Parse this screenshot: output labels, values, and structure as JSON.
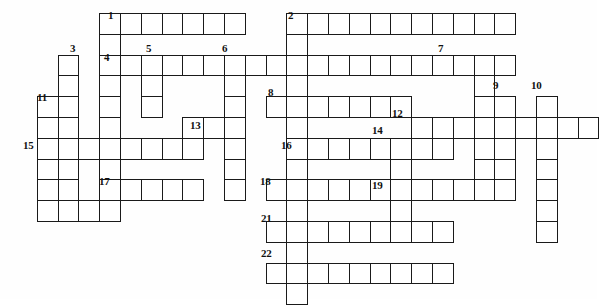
{
  "puzzle": {
    "type": "crossword-grid",
    "title": "Crossword puzzle grid",
    "background_color": "#ffffff",
    "cell_border_color": "#1a1a1a",
    "cell_fill_color": "#ffffff",
    "number_color": "#111111",
    "cell_size": 20.8,
    "origin_x": 16,
    "origin_y": 13,
    "grid_columns": 28,
    "grid_rows": 14,
    "entries": [
      {
        "number": "1",
        "direction": "across",
        "col": 4,
        "row": 0,
        "length": 7
      },
      {
        "number": "2",
        "direction": "across",
        "col": 13,
        "row": 0,
        "length": 11
      },
      {
        "number": "3",
        "direction": "down",
        "col": 2,
        "row": 2,
        "length": 7
      },
      {
        "number": "4",
        "direction": "across",
        "col": 4,
        "row": 2,
        "length": 20
      },
      {
        "number": "5",
        "direction": "down",
        "col": 6,
        "row": 2,
        "length": 4
      },
      {
        "number": "6",
        "direction": "down",
        "col": 10,
        "row": 2,
        "length": 6
      },
      {
        "number": "7",
        "direction": "down",
        "col": 22,
        "row": 2,
        "length": 7
      },
      {
        "number": "8",
        "direction": "across",
        "col": 12,
        "row": 4,
        "length": 7
      },
      {
        "number": "9",
        "direction": "down",
        "col": 23,
        "row": 4,
        "length": 5
      },
      {
        "number": "10",
        "direction": "down",
        "col": 25,
        "row": 4,
        "length": 7
      },
      {
        "number": "11",
        "direction": "down",
        "col": 1,
        "row": 4,
        "length": 6
      },
      {
        "number": "12",
        "direction": "across",
        "col": 19,
        "row": 5,
        "length": 9
      },
      {
        "number": "13",
        "direction": "across",
        "col": 8,
        "row": 5,
        "length": 3
      },
      {
        "number": "14",
        "direction": "down",
        "col": 18,
        "row": 6,
        "length": 5
      },
      {
        "number": "15",
        "direction": "across",
        "col": 1,
        "row": 6,
        "length": 8
      },
      {
        "number": "16",
        "direction": "across",
        "col": 13,
        "row": 6,
        "length": 8
      },
      {
        "number": "17",
        "direction": "across",
        "col": 5,
        "row": 8,
        "length": 4
      },
      {
        "number": "18",
        "direction": "across",
        "col": 12,
        "row": 8,
        "length": 6
      },
      {
        "number": "19",
        "direction": "across",
        "col": 18,
        "row": 8,
        "length": 6
      },
      {
        "number": "21",
        "direction": "across",
        "col": 12,
        "row": 10,
        "length": 9
      },
      {
        "number": "22",
        "direction": "across",
        "col": 12,
        "row": 12,
        "length": 9
      }
    ],
    "cells": [
      [
        4,
        0
      ],
      [
        5,
        0
      ],
      [
        6,
        0
      ],
      [
        7,
        0
      ],
      [
        8,
        0
      ],
      [
        9,
        0
      ],
      [
        10,
        0
      ],
      [
        13,
        0
      ],
      [
        14,
        0
      ],
      [
        15,
        0
      ],
      [
        16,
        0
      ],
      [
        17,
        0
      ],
      [
        18,
        0
      ],
      [
        19,
        0
      ],
      [
        20,
        0
      ],
      [
        21,
        0
      ],
      [
        22,
        0
      ],
      [
        23,
        0
      ],
      [
        4,
        1
      ],
      [
        13,
        1
      ],
      [
        2,
        2
      ],
      [
        4,
        2
      ],
      [
        5,
        2
      ],
      [
        6,
        2
      ],
      [
        7,
        2
      ],
      [
        8,
        2
      ],
      [
        9,
        2
      ],
      [
        10,
        2
      ],
      [
        11,
        2
      ],
      [
        12,
        2
      ],
      [
        13,
        2
      ],
      [
        14,
        2
      ],
      [
        15,
        2
      ],
      [
        16,
        2
      ],
      [
        17,
        2
      ],
      [
        18,
        2
      ],
      [
        19,
        2
      ],
      [
        20,
        2
      ],
      [
        21,
        2
      ],
      [
        22,
        2
      ],
      [
        23,
        2
      ],
      [
        2,
        3
      ],
      [
        4,
        3
      ],
      [
        6,
        3
      ],
      [
        10,
        3
      ],
      [
        13,
        3
      ],
      [
        22,
        3
      ],
      [
        1,
        4
      ],
      [
        2,
        4
      ],
      [
        4,
        4
      ],
      [
        6,
        4
      ],
      [
        10,
        4
      ],
      [
        12,
        4
      ],
      [
        13,
        4
      ],
      [
        14,
        4
      ],
      [
        15,
        4
      ],
      [
        16,
        4
      ],
      [
        17,
        4
      ],
      [
        18,
        4
      ],
      [
        22,
        4
      ],
      [
        23,
        4
      ],
      [
        25,
        4
      ],
      [
        1,
        5
      ],
      [
        2,
        5
      ],
      [
        4,
        5
      ],
      [
        10,
        5
      ],
      [
        13,
        5
      ],
      [
        19,
        5
      ],
      [
        20,
        5
      ],
      [
        21,
        5
      ],
      [
        22,
        5
      ],
      [
        23,
        5
      ],
      [
        24,
        5
      ],
      [
        25,
        5
      ],
      [
        26,
        5
      ],
      [
        27,
        5
      ],
      [
        8,
        5
      ],
      [
        9,
        5
      ],
      [
        10,
        5
      ],
      [
        1,
        6
      ],
      [
        2,
        6
      ],
      [
        3,
        6
      ],
      [
        4,
        6
      ],
      [
        5,
        6
      ],
      [
        6,
        6
      ],
      [
        7,
        6
      ],
      [
        8,
        6
      ],
      [
        10,
        6
      ],
      [
        13,
        6
      ],
      [
        14,
        6
      ],
      [
        15,
        6
      ],
      [
        16,
        6
      ],
      [
        17,
        6
      ],
      [
        18,
        6
      ],
      [
        19,
        6
      ],
      [
        20,
        6
      ],
      [
        22,
        6
      ],
      [
        23,
        6
      ],
      [
        25,
        6
      ],
      [
        1,
        7
      ],
      [
        2,
        7
      ],
      [
        4,
        7
      ],
      [
        10,
        7
      ],
      [
        13,
        7
      ],
      [
        18,
        7
      ],
      [
        22,
        7
      ],
      [
        23,
        7
      ],
      [
        25,
        7
      ],
      [
        1,
        8
      ],
      [
        5,
        8
      ],
      [
        6,
        8
      ],
      [
        7,
        8
      ],
      [
        8,
        8
      ],
      [
        10,
        8
      ],
      [
        12,
        8
      ],
      [
        13,
        8
      ],
      [
        14,
        8
      ],
      [
        15,
        8
      ],
      [
        16,
        8
      ],
      [
        17,
        8
      ],
      [
        18,
        8
      ],
      [
        19,
        8
      ],
      [
        20,
        8
      ],
      [
        21,
        8
      ],
      [
        22,
        8
      ],
      [
        23,
        8
      ],
      [
        25,
        8
      ],
      [
        1,
        9
      ],
      [
        2,
        9
      ],
      [
        3,
        9
      ],
      [
        4,
        9
      ],
      [
        13,
        9
      ],
      [
        18,
        9
      ],
      [
        25,
        9
      ],
      [
        12,
        10
      ],
      [
        13,
        10
      ],
      [
        14,
        10
      ],
      [
        15,
        10
      ],
      [
        16,
        10
      ],
      [
        17,
        10
      ],
      [
        18,
        10
      ],
      [
        19,
        10
      ],
      [
        20,
        10
      ],
      [
        25,
        10
      ],
      [
        13,
        11
      ],
      [
        12,
        12
      ],
      [
        13,
        12
      ],
      [
        14,
        12
      ],
      [
        15,
        12
      ],
      [
        16,
        12
      ],
      [
        17,
        12
      ],
      [
        18,
        12
      ],
      [
        19,
        12
      ],
      [
        20,
        12
      ],
      [
        13,
        13
      ]
    ],
    "cell_runs": [
      {
        "name": "across-1",
        "col": 4,
        "row": 0,
        "len": 7,
        "dir": "h"
      },
      {
        "name": "across-2",
        "col": 13,
        "row": 0,
        "len": 11,
        "dir": "h"
      },
      {
        "name": "down-1",
        "col": 4,
        "row": 0,
        "len": 10,
        "dir": "v"
      },
      {
        "name": "down-2",
        "col": 13,
        "row": 0,
        "len": 14,
        "dir": "v"
      },
      {
        "name": "down-3",
        "col": 2,
        "row": 2,
        "len": 8,
        "dir": "v"
      },
      {
        "name": "across-4",
        "col": 4,
        "row": 2,
        "len": 20,
        "dir": "h"
      },
      {
        "name": "down-5",
        "col": 6,
        "row": 2,
        "len": 3,
        "dir": "v"
      },
      {
        "name": "down-6",
        "col": 10,
        "row": 2,
        "len": 7,
        "dir": "v"
      },
      {
        "name": "down-7",
        "col": 22,
        "row": 2,
        "len": 7,
        "dir": "v"
      },
      {
        "name": "across-8",
        "col": 12,
        "row": 4,
        "len": 7,
        "dir": "h"
      },
      {
        "name": "down-9",
        "col": 23,
        "row": 4,
        "len": 5,
        "dir": "v"
      },
      {
        "name": "down-10",
        "col": 25,
        "row": 4,
        "len": 7,
        "dir": "v"
      },
      {
        "name": "down-11",
        "col": 1,
        "row": 4,
        "len": 6,
        "dir": "v"
      },
      {
        "name": "across-12",
        "col": 19,
        "row": 5,
        "len": 9,
        "dir": "h"
      },
      {
        "name": "across-13",
        "col": 8,
        "row": 5,
        "len": 3,
        "dir": "h"
      },
      {
        "name": "down-14",
        "col": 18,
        "row": 6,
        "len": 4,
        "dir": "v"
      },
      {
        "name": "across-15",
        "col": 1,
        "row": 6,
        "len": 8,
        "dir": "h"
      },
      {
        "name": "across-16",
        "col": 13,
        "row": 6,
        "len": 8,
        "dir": "h"
      },
      {
        "name": "across-17",
        "col": 5,
        "row": 8,
        "len": 4,
        "dir": "h"
      },
      {
        "name": "across-18",
        "col": 12,
        "row": 8,
        "len": 6,
        "dir": "h"
      },
      {
        "name": "across-19",
        "col": 18,
        "row": 8,
        "len": 6,
        "dir": "h"
      },
      {
        "name": "down-15b",
        "col": 1,
        "row": 6,
        "len": 4,
        "dir": "v"
      },
      {
        "name": "across-20",
        "col": 1,
        "row": 9,
        "len": 4,
        "dir": "h"
      },
      {
        "name": "across-21",
        "col": 12,
        "row": 10,
        "len": 9,
        "dir": "h"
      },
      {
        "name": "across-22",
        "col": 12,
        "row": 12,
        "len": 9,
        "dir": "h"
      },
      {
        "name": "down-4b",
        "col": 4,
        "row": 3,
        "len": 7,
        "dir": "v"
      },
      {
        "name": "down-6b",
        "col": 10,
        "row": 3,
        "len": 6,
        "dir": "v"
      },
      {
        "name": "down-13",
        "col": 10,
        "row": 6,
        "len": 3,
        "dir": "v"
      }
    ],
    "numbers": [
      {
        "label": "1",
        "x": 108,
        "y": 10
      },
      {
        "label": "2",
        "x": 288,
        "y": 10
      },
      {
        "label": "3",
        "x": 70,
        "y": 43
      },
      {
        "label": "4",
        "x": 104,
        "y": 52
      },
      {
        "label": "5",
        "x": 146,
        "y": 43
      },
      {
        "label": "6",
        "x": 222,
        "y": 43
      },
      {
        "label": "7",
        "x": 438,
        "y": 43
      },
      {
        "label": "8",
        "x": 268,
        "y": 87
      },
      {
        "label": "9",
        "x": 493,
        "y": 80
      },
      {
        "label": "10",
        "x": 531,
        "y": 80
      },
      {
        "label": "11",
        "x": 37,
        "y": 92
      },
      {
        "label": "12",
        "x": 392,
        "y": 108
      },
      {
        "label": "13",
        "x": 190,
        "y": 120
      },
      {
        "label": "14",
        "x": 372,
        "y": 125
      },
      {
        "label": "15",
        "x": 23,
        "y": 140
      },
      {
        "label": "16",
        "x": 281,
        "y": 140
      },
      {
        "label": "17",
        "x": 99,
        "y": 176
      },
      {
        "label": "18",
        "x": 260,
        "y": 176
      },
      {
        "label": "19",
        "x": 372,
        "y": 180
      },
      {
        "label": "21",
        "x": 261,
        "y": 213
      },
      {
        "label": "22",
        "x": 261,
        "y": 248
      }
    ]
  }
}
